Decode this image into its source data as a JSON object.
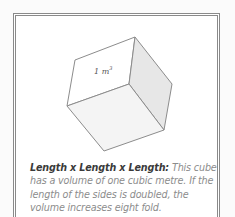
{
  "figure": {
    "cube_label": "1 m",
    "cube_label_exponent": "3",
    "colors": {
      "top_face": "#ffffff",
      "right_face": "#e7e7e7",
      "bottom_face": "#f4f4f4",
      "edge": "#8c8c8c"
    }
  },
  "caption": {
    "lead": "Length x Length x Length:",
    "body": " This cube has a volume of one cubic metre. If the length of the sides is doubled, the volume increases eight fold."
  }
}
